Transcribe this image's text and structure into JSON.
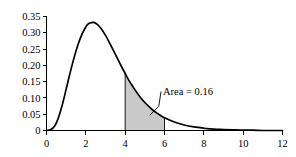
{
  "chart_data": {
    "type": "line",
    "title": "",
    "subtitle": "",
    "xlabel": "",
    "ylabel": "",
    "xlim": [
      0,
      12
    ],
    "ylim": [
      0,
      0.35
    ],
    "grid": false,
    "legend": "none",
    "x_ticks": [
      "0",
      "2",
      "4",
      "6",
      "8",
      "10",
      "12"
    ],
    "x_tick_values": [
      0,
      2,
      4,
      6,
      8,
      10,
      12
    ],
    "y_ticks": [
      "0",
      "0.05",
      "0.10",
      "0.15",
      "0.20",
      "0.25",
      "0.30",
      "0.35"
    ],
    "y_tick_values": [
      0,
      0.05,
      0.1,
      0.15,
      0.2,
      0.25,
      0.3,
      0.35
    ],
    "series": [
      {
        "name": "density",
        "x": [
          0.0,
          0.2,
          0.4,
          0.6,
          0.8,
          1.0,
          1.2,
          1.4,
          1.6,
          1.8,
          2.0,
          2.1,
          2.2,
          2.4,
          2.6,
          2.8,
          3.0,
          3.2,
          3.4,
          3.6,
          3.8,
          4.0,
          4.2,
          4.4,
          4.6,
          4.8,
          5.0,
          5.2,
          5.4,
          5.6,
          5.8,
          6.0,
          6.5,
          7.0,
          7.5,
          8.0,
          8.5,
          9.0,
          9.5,
          10.0,
          10.5,
          11.0,
          11.5,
          12.0
        ],
        "values": [
          0.0,
          0.002,
          0.012,
          0.038,
          0.078,
          0.127,
          0.177,
          0.223,
          0.263,
          0.295,
          0.318,
          0.326,
          0.33,
          0.332,
          0.325,
          0.311,
          0.292,
          0.27,
          0.246,
          0.222,
          0.198,
          0.175,
          0.153,
          0.134,
          0.116,
          0.1,
          0.086,
          0.074,
          0.063,
          0.054,
          0.046,
          0.039,
          0.026,
          0.017,
          0.011,
          0.007,
          0.004,
          0.003,
          0.002,
          0.001,
          0.001,
          0.0,
          0.0,
          0.0
        ]
      }
    ],
    "shaded_region": {
      "x_start": 4,
      "x_end": 6,
      "fill_color": "#c9c9c9",
      "label": "Area = 0.16",
      "area_value": 0.16
    },
    "colors": {
      "curve": "#000000",
      "axis": "#000000",
      "shade": "#c9c9c9",
      "background": "#ffffff"
    }
  },
  "annotation": {
    "area_text": "Area = 0.16"
  },
  "axes": {
    "y_labels": [
      "0.35",
      "0.30",
      "0.25",
      "0.20",
      "0.15",
      "0.10",
      "0.05",
      "0"
    ],
    "x_labels": [
      "0",
      "2",
      "4",
      "6",
      "8",
      "10",
      "12"
    ]
  }
}
